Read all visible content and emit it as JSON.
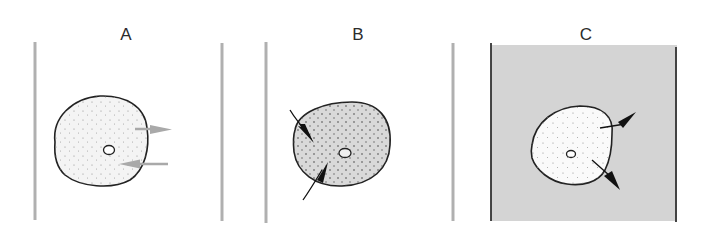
{
  "figure": {
    "panels": [
      {
        "id": "A",
        "label": "A",
        "condition": "isotonic",
        "medium_color": "#ffffff",
        "cell_fill": "#f3f3f3",
        "arrows": [
          {
            "direction": "out",
            "color": "#a9a9a9"
          },
          {
            "direction": "in",
            "color": "#a9a9a9"
          }
        ]
      },
      {
        "id": "B",
        "label": "B",
        "condition": "hypotonic",
        "medium_color": "#ffffff",
        "cell_fill": "#d9d9d9",
        "arrows": [
          {
            "direction": "in",
            "color": "#1a1a1a"
          },
          {
            "direction": "in",
            "color": "#1a1a1a"
          }
        ]
      },
      {
        "id": "C",
        "label": "C",
        "condition": "hypertonic",
        "medium_color": "#d4d4d4",
        "cell_fill": "#fafafa",
        "arrows": [
          {
            "direction": "out",
            "color": "#1a1a1a"
          },
          {
            "direction": "out",
            "color": "#1a1a1a"
          }
        ]
      }
    ]
  }
}
